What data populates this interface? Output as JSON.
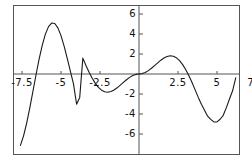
{
  "chart_data": {
    "type": "line",
    "title": "",
    "subtitle": "",
    "xlabel": "",
    "ylabel": "",
    "xlim": [
      -8.1,
      8.1
    ],
    "ylim": [
      -7.5,
      7.5
    ],
    "grid": false,
    "legend": null,
    "line_color": "#1a1a1a",
    "axis_color": "#555555",
    "background_color": "#ffffff",
    "x_ticks": [
      {
        "value": -7.5,
        "label": "-7.5"
      },
      {
        "value": -5,
        "label": "-5"
      },
      {
        "value": -2.5,
        "label": "-2.5"
      },
      {
        "value": 2.5,
        "label": "2.5"
      },
      {
        "value": 5,
        "label": "5"
      },
      {
        "value": 7.5,
        "label": "7.5"
      }
    ],
    "y_ticks": [
      {
        "value": 6,
        "label": "6"
      },
      {
        "value": 4,
        "label": "4"
      },
      {
        "value": 2,
        "label": "2"
      },
      {
        "value": -2,
        "label": "-2"
      },
      {
        "value": -4,
        "label": "-4"
      },
      {
        "value": -6,
        "label": "-6"
      }
    ],
    "series": [
      {
        "name": "x*sin(x)",
        "x": [
          -8.0,
          -7.8,
          -7.6,
          -7.4,
          -7.2,
          -7.0,
          -6.8,
          -6.6,
          -6.4,
          -6.2,
          -6.0,
          -5.8,
          -5.6,
          -5.4,
          -5.2,
          -5.0,
          -4.8,
          -4.6,
          -4.4,
          -4.2,
          -4.0,
          -3.8,
          -3.6,
          -3.4,
          -3.2,
          -3.0,
          -2.8,
          -2.6,
          -2.4,
          -2.2,
          -2.0,
          -1.8,
          -1.6,
          -1.4,
          -1.2,
          -1.0,
          -0.8,
          -0.6,
          -0.4,
          -0.2,
          0.0,
          0.2,
          0.4,
          0.6,
          0.8,
          1.0,
          1.2,
          1.4,
          1.6,
          1.8,
          2.0,
          2.2,
          2.4,
          2.6,
          2.8,
          3.0,
          3.2,
          3.4,
          3.6,
          3.8,
          4.0,
          4.2,
          4.4,
          4.6,
          4.8,
          5.0,
          5.2,
          5.4,
          5.6,
          5.8,
          6.0,
          6.2,
          6.4,
          6.6,
          6.8,
          7.0,
          7.2,
          7.4,
          7.6,
          7.8,
          8.0
        ],
        "y": [
          -7.915,
          -7.732,
          -7.143,
          -6.181,
          -4.904,
          -3.392,
          -1.745,
          -0.075,
          1.505,
          2.89,
          3.991,
          4.74,
          5.096,
          5.047,
          4.613,
          3.837,
          2.794,
          1.573,
          0.276,
          -0.985,
          -3.027,
          -2.341,
          1.585,
          0.858,
          0.185,
          -0.423,
          -0.939,
          -1.342,
          -1.62,
          -1.768,
          -1.819,
          -1.753,
          -1.6,
          -1.38,
          -1.118,
          -0.841,
          -0.574,
          -0.339,
          -0.156,
          -0.04,
          0.0,
          0.04,
          0.156,
          0.339,
          0.574,
          0.841,
          1.118,
          1.38,
          1.6,
          1.753,
          1.819,
          1.768,
          1.62,
          1.342,
          0.939,
          0.423,
          -0.185,
          -0.858,
          -1.585,
          -2.341,
          -3.027,
          -3.629,
          -4.22,
          -4.534,
          -4.792,
          -4.795,
          -4.522,
          -4.133,
          -3.362,
          -2.506,
          -1.676,
          -0.387,
          1.124,
          2.695,
          4.176,
          4.597,
          5.448,
          6.185,
          6.303,
          5.941,
          5.078
        ]
      }
    ]
  },
  "axes": {
    "x_axis_name": "x-axis",
    "y_axis_name": "y-axis"
  }
}
